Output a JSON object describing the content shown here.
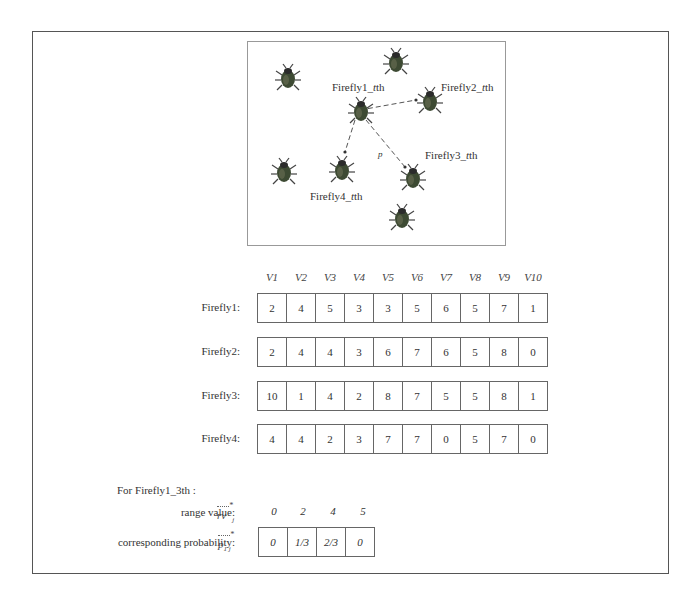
{
  "diagram": {
    "panel": {
      "labels": {
        "firefly1": "Firefly1_",
        "firefly2": "Firefly2_",
        "firefly3": "Firefly3_",
        "firefly4": "Firefly4_",
        "t_suffix": "t",
        "th_suffix": "th",
        "p_marker": "p"
      },
      "icons": [
        "firefly-icon"
      ]
    },
    "vector_headers": [
      "V1",
      "V2",
      "V3",
      "V4",
      "V5",
      "V6",
      "V7",
      "V8",
      "V9",
      "V10"
    ],
    "fireflies": [
      {
        "label": "Firefly1:",
        "values": [
          2,
          4,
          5,
          3,
          3,
          5,
          6,
          5,
          7,
          1
        ]
      },
      {
        "label": "Firefly2:",
        "values": [
          2,
          4,
          4,
          3,
          6,
          7,
          6,
          5,
          8,
          0
        ]
      },
      {
        "label": "Firefly3:",
        "values": [
          10,
          1,
          4,
          2,
          8,
          7,
          5,
          5,
          8,
          1
        ]
      },
      {
        "label": "Firefly4:",
        "values": [
          4,
          4,
          2,
          3,
          7,
          7,
          0,
          5,
          7,
          0
        ]
      }
    ],
    "section": {
      "title": "For Firefly1_3th :",
      "range_label": "range value:",
      "range_symbol": "rv",
      "range_subscript": "j",
      "prob_label": "corresponding probability:",
      "prob_symbol": "p",
      "prob_subscript": "1 j",
      "range_values": [
        "0",
        "2",
        "4",
        "5"
      ],
      "probabilities": [
        "0",
        "1/3",
        "2/3",
        "0"
      ]
    }
  }
}
